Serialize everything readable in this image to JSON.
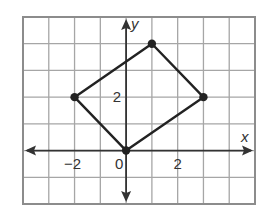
{
  "chart_data": {
    "type": "scatter",
    "title": "",
    "xlabel": "x",
    "ylabel": "y",
    "xlim": [
      -4,
      5
    ],
    "ylim": [
      -2,
      5
    ],
    "grid": true,
    "grid_step": 1,
    "x_tick_labels": [
      {
        "value": -2,
        "label": "−2"
      },
      {
        "value": 0,
        "label": "0"
      },
      {
        "value": 2,
        "label": "2"
      }
    ],
    "y_tick_labels": [
      {
        "value": 2,
        "label": "2"
      }
    ],
    "series": [
      {
        "name": "quadrilateral",
        "closed": true,
        "points": [
          {
            "x": 0,
            "y": 0
          },
          {
            "x": -2,
            "y": 2
          },
          {
            "x": 1,
            "y": 4
          },
          {
            "x": 3,
            "y": 2
          }
        ]
      }
    ]
  },
  "colors": {
    "grid": "#a6a6a6",
    "border": "#8c8c8c",
    "axis": "#333333",
    "shape": "#222222",
    "background": "#ffffff"
  }
}
